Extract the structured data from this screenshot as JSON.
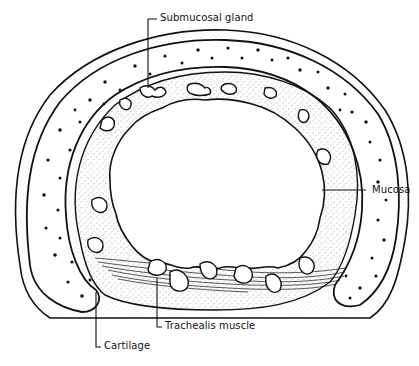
{
  "diagram": {
    "labels": {
      "submucosal_gland": "Submucosal gland",
      "mucosa": "Mucosa",
      "trachealis_muscle": "Trachealis muscle",
      "cartilage": "Cartilage"
    },
    "colors": {
      "ink": "#111111",
      "background": "#ffffff",
      "stipple": "#555555"
    }
  }
}
